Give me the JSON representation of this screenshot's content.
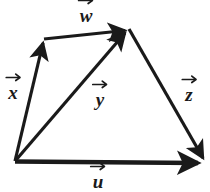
{
  "figure": {
    "background_color": "#ffffff",
    "stroke_color": "#1a1a1a",
    "width": 210,
    "height": 192
  },
  "points": {
    "bottom_left": {
      "x": 15,
      "y": 161
    },
    "top_left": {
      "x": 43,
      "y": 40
    },
    "apex": {
      "x": 129,
      "y": 29
    },
    "bottom_right": {
      "x": 205,
      "y": 163
    }
  },
  "vectors": [
    {
      "name": "x",
      "label": "x",
      "from": "bottom_left",
      "to": "top_left",
      "arrow_at": "to",
      "stroke_width": 3.2,
      "label_pos": {
        "x": 13,
        "y": 91
      }
    },
    {
      "name": "w",
      "label": "w",
      "from": "top_left",
      "to": "apex",
      "arrow_at": "to",
      "stroke_width": 3.2,
      "label_pos": {
        "x": 86,
        "y": 14
      }
    },
    {
      "name": "z",
      "label": "z",
      "from": "apex",
      "to": "bottom_right",
      "arrow_at": "to",
      "stroke_width": 3.2,
      "label_pos": {
        "x": 189,
        "y": 93
      }
    },
    {
      "name": "u",
      "label": "u",
      "from": "bottom_left",
      "to": "bottom_right",
      "arrow_at": "to",
      "stroke_width": 4.6,
      "label_pos": {
        "x": 98,
        "y": 180
      }
    },
    {
      "name": "y",
      "label": "y",
      "from": "bottom_left",
      "to": "apex",
      "arrow_at": "to",
      "stroke_width": 3.2,
      "label_pos": {
        "x": 100,
        "y": 98
      }
    }
  ]
}
